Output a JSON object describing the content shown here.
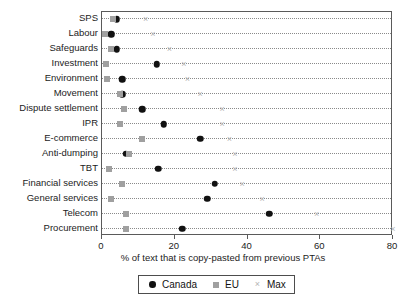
{
  "chart_data": {
    "type": "scatter",
    "title": "",
    "xlabel": "% of text that is copy-pasted from previous PTAs",
    "ylabel": "",
    "xlim": [
      0,
      80
    ],
    "xticks": [
      0,
      20,
      40,
      60,
      80
    ],
    "xticklabels": [
      "0",
      "20",
      "40",
      "60",
      "80"
    ],
    "grid": "horizontal-dotted",
    "legend_position": "bottom-center",
    "categories": [
      "SPS",
      "Labour",
      "Safeguards",
      "Investment",
      "Environment",
      "Movement",
      "Dispute settlement",
      "IPR",
      "E-commerce",
      "Anti-dumping",
      "TBT",
      "Financial services",
      "General services",
      "Telecom",
      "Procurement"
    ],
    "series": [
      {
        "name": "Canada",
        "marker": "circle",
        "color": "#111111",
        "values": [
          4,
          2.5,
          4,
          15,
          5.5,
          5.5,
          11,
          17,
          27,
          6.5,
          15.5,
          31,
          29,
          46,
          22
        ]
      },
      {
        "name": "EU",
        "marker": "square",
        "color": "#a0a0a0",
        "values": [
          3,
          0.8,
          2.5,
          1,
          1.5,
          5,
          6,
          5,
          11,
          7.5,
          2,
          5.5,
          2.5,
          6.5,
          6.5
        ]
      },
      {
        "name": "Max",
        "marker": "x",
        "color": "#b4b4b4",
        "values": [
          12,
          14,
          18.5,
          22.5,
          23.5,
          27,
          33,
          33,
          35,
          36.5,
          36.5,
          38.5,
          44,
          59,
          80
        ]
      }
    ]
  },
  "legend": {
    "entries": [
      {
        "label": "Canada",
        "symbol": "circle-marker"
      },
      {
        "label": "EU",
        "symbol": "square-marker"
      },
      {
        "label": "Max",
        "symbol": "x-marker"
      }
    ]
  },
  "axis": {
    "x_title": "% of text that is copy-pasted from previous PTAs"
  },
  "symbols": {
    "x_glyph": "×"
  }
}
